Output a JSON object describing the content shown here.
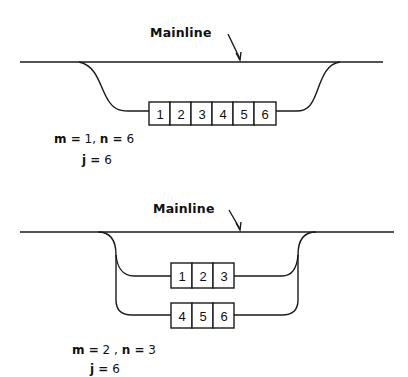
{
  "diagram1": {
    "mainline_label": "Mainline",
    "boxes": [
      "1",
      "2",
      "3",
      "4",
      "5",
      "6"
    ],
    "params_line1": {
      "m_label": "m =",
      "m_value": "1,",
      "n_label": "n =",
      "n_value": "6"
    },
    "params_line2": {
      "j_label": "j =",
      "j_value": "6"
    }
  },
  "diagram2": {
    "mainline_label": "Mainline",
    "branch_top_boxes": [
      "1",
      "2",
      "3"
    ],
    "branch_bottom_boxes": [
      "4",
      "5",
      "6"
    ],
    "params_line1": {
      "m_label": "m =",
      "m_value": "2 ,",
      "n_label": "n =",
      "n_value": "3"
    },
    "params_line2": {
      "j_label": "j =",
      "j_value": "6"
    }
  },
  "colors": {
    "line": "#1a1a1a",
    "background": "#ffffff"
  }
}
